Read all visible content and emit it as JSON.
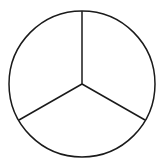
{
  "diagram": {
    "type": "circle-divided-into-equal-sectors",
    "sector_count": 3,
    "stroke_color": "#1a1a1a",
    "fill_color": "#ffffff",
    "background": "#ffffff",
    "circle": {
      "cx": 82,
      "cy": 84,
      "r": 73
    },
    "spokes": [
      {
        "name": "spoke-top",
        "x2": 82,
        "y2": 11
      },
      {
        "name": "spoke-lower-left",
        "x2": 19,
        "y2": 120
      },
      {
        "name": "spoke-lower-right",
        "x2": 145,
        "y2": 120
      }
    ]
  }
}
